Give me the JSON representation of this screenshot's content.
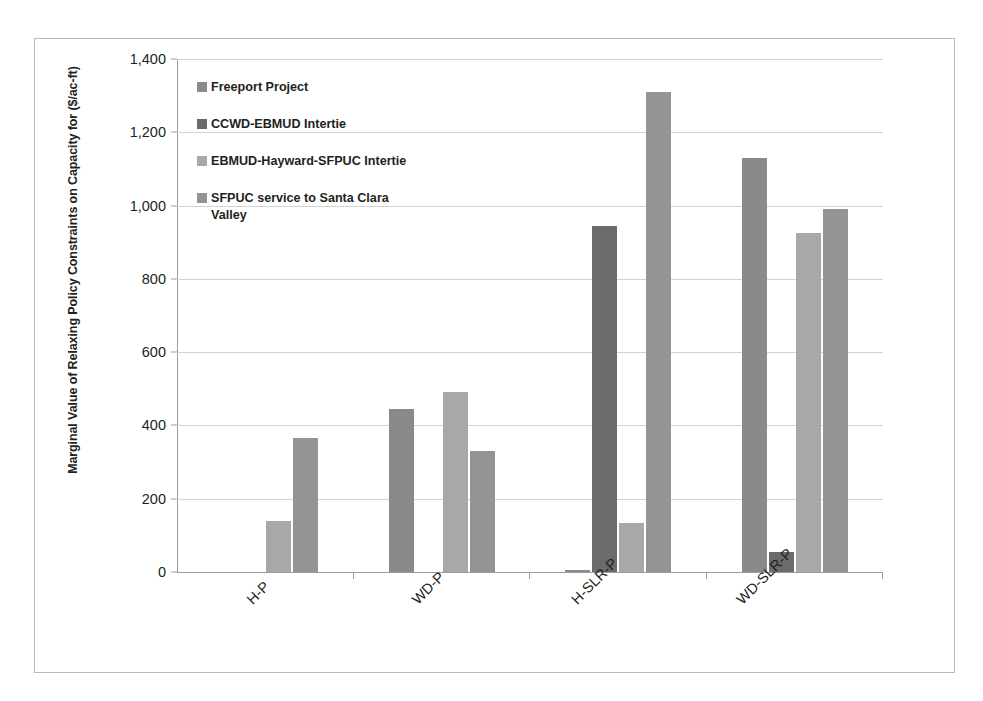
{
  "chart_data": {
    "type": "bar",
    "title": "",
    "xlabel": "",
    "ylabel": "Marginal Value of Relaxing Policy Constraints on Capacity for ($/ac-ft)",
    "categories": [
      "H-P",
      "WD-P",
      "H-SLR-P",
      "WD-SLR-P"
    ],
    "ylim": [
      0,
      1400
    ],
    "yticks": [
      0,
      200,
      400,
      600,
      800,
      1000,
      1200,
      1400
    ],
    "ytick_labels": [
      "0",
      "200",
      "400",
      "600",
      "800",
      "1,000",
      "1,200",
      "1,400"
    ],
    "grid": true,
    "legend_position": "inside-upper-left",
    "series": [
      {
        "name": "Freeport Project",
        "color": "#8a8a8a",
        "values": [
          0,
          445,
          5,
          1130
        ]
      },
      {
        "name": "CCWD-EBMUD Intertie",
        "color": "#6b6b6b",
        "values": [
          0,
          0,
          945,
          55
        ]
      },
      {
        "name": "EBMUD-Hayward-SFPUC Intertie",
        "color": "#a8a8a8",
        "values": [
          140,
          490,
          135,
          925
        ]
      },
      {
        "name": "SFPUC service to Santa Clara Valley",
        "color": "#949494",
        "values": [
          365,
          330,
          1310,
          990
        ]
      }
    ]
  },
  "legend": {
    "items": [
      {
        "label": "Freeport Project",
        "color": "#8a8a8a"
      },
      {
        "label": "CCWD-EBMUD Intertie",
        "color": "#6b6b6b"
      },
      {
        "label": "EBMUD-Hayward-SFPUC Intertie",
        "color": "#a8a8a8"
      },
      {
        "label": "SFPUC service to Santa Clara Valley",
        "color": "#949494"
      }
    ]
  },
  "axis": {
    "y_title": "Marginal Value of Relaxing Policy Constraints on Capacity for ($/ac-ft)"
  }
}
